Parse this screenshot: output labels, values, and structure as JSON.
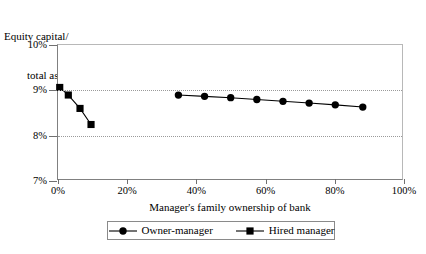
{
  "chart_data": {
    "type": "line",
    "title": "",
    "ylabel": "Equity capital/\ntotal assets",
    "ylabel_line1": "Equity capital/",
    "ylabel_line2": "total assets",
    "xlabel": "Manager's family ownership of bank",
    "xlim": [
      0,
      100
    ],
    "ylim": [
      7,
      10
    ],
    "xticks": [
      0,
      20,
      40,
      60,
      80,
      100
    ],
    "xticklabels": [
      "0%",
      "20%",
      "40%",
      "60%",
      "80%",
      "100%"
    ],
    "yticks": [
      7,
      8,
      9,
      10
    ],
    "yticklabels": [
      "7%",
      "8%",
      "9%",
      "10%"
    ],
    "gridlines_y": [
      8,
      9
    ],
    "grid": "horizontal-dotted",
    "legend_position": "bottom-center",
    "series": [
      {
        "name": "Owner-manager",
        "marker": "circle",
        "color": "#000000",
        "x": [
          35.0,
          42.6,
          50.2,
          57.8,
          65.4,
          73.0,
          80.6,
          88.6
        ],
        "y": [
          8.88,
          8.85,
          8.82,
          8.78,
          8.74,
          8.7,
          8.66,
          8.61
        ]
      },
      {
        "name": "Hired manager",
        "marker": "square",
        "color": "#000000",
        "x": [
          0.5,
          3.0,
          6.4,
          9.6
        ],
        "y": [
          9.05,
          8.88,
          8.58,
          8.22
        ]
      }
    ]
  },
  "legend": {
    "items": [
      {
        "label": "Owner-manager",
        "marker": "circle"
      },
      {
        "label": "Hired manager",
        "marker": "square"
      }
    ]
  }
}
